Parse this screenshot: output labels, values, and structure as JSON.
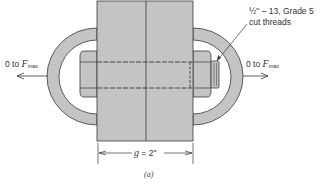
{
  "figure": {
    "caption": "(a)",
    "bolt_spec_line1": "½'' – 13, Grade 5",
    "bolt_spec_line2": "cut threads",
    "left_force": {
      "prefix": "0 to ",
      "symbol": "F",
      "subscript": "max"
    },
    "right_force": {
      "prefix": "0 to ",
      "symbol": "F",
      "subscript": "max"
    },
    "dimension": {
      "var": "g",
      "value": " = 2''"
    }
  },
  "colors": {
    "fill": "#c4c4c4",
    "stroke": "#3a3a3a",
    "background": "#ffffff"
  }
}
